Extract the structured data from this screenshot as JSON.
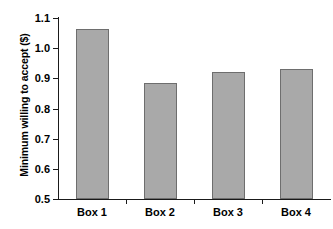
{
  "chart_data": {
    "type": "bar",
    "title": "",
    "xlabel": "",
    "ylabel": "Minimum willing to accept ($)",
    "categories": [
      "Box 1",
      "Box 2",
      "Box 3",
      "Box 4"
    ],
    "values": [
      1.065,
      0.885,
      0.92,
      0.93
    ],
    "ylim": [
      0.5,
      1.1
    ],
    "ytick_labels": [
      "1.1",
      "1.0",
      "0.9",
      "0.8",
      "0.7",
      "0.6",
      "0.5"
    ],
    "ytick_values": [
      1.1,
      1.0,
      0.9,
      0.8,
      0.7,
      0.6,
      0.5
    ],
    "grid": false,
    "legend": false,
    "legend_position": "none",
    "bar_fill_color": "#a9a9a9",
    "bar_border_color": "#6e6e6e",
    "axis_color": "#1a1a1a",
    "background_color": "#ffffff"
  },
  "axes": {
    "y_title": "Minimum willing to accept ($)"
  }
}
